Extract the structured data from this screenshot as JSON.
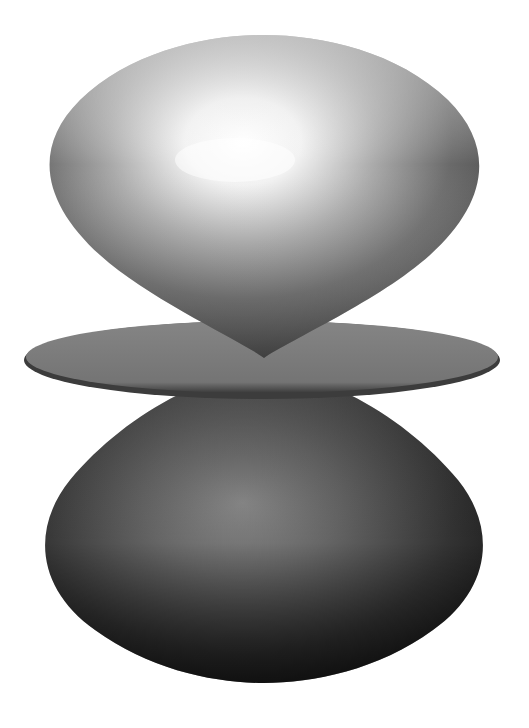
{
  "figure": {
    "background": "#ffffff",
    "parts": {
      "top_lobe": {
        "highlight": "#ffffff",
        "mid": "#b8b8b8",
        "shadow": "#3a3a3a"
      },
      "torus_ring": {
        "fill": "#7a7a7a",
        "edge": "#3c3c3c"
      },
      "bottom_lobe": {
        "highlight": "#8a8a8a",
        "mid": "#555555",
        "shadow": "#0e0e0e"
      }
    }
  }
}
